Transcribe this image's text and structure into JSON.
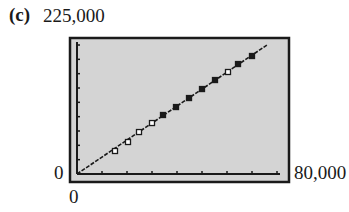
{
  "figure": {
    "panel_label": "(c)",
    "y_max_label": "225,000",
    "y_min_label": "0",
    "x_min_label": "0",
    "x_max_label": "80,000"
  },
  "colors": {
    "frame": "#1a1a1a",
    "plot_background": "#d4d4d4",
    "line": "#1a1a1a",
    "marker": "#1a1a1a"
  },
  "chart_data": {
    "type": "scatter",
    "title": "",
    "panel": "(c)",
    "xlabel": "",
    "ylabel": "",
    "xlim": [
      0,
      80000
    ],
    "ylim": [
      0,
      225000
    ],
    "x_tick_step": 10000,
    "y_tick_step": 25000,
    "grid": false,
    "legend": null,
    "series": [
      {
        "name": "data points",
        "marker": "square",
        "points": [
          {
            "x": 15200,
            "y": 40100,
            "filled": false
          },
          {
            "x": 20400,
            "y": 55800,
            "filled": false
          },
          {
            "x": 24800,
            "y": 73200,
            "filled": false
          },
          {
            "x": 30000,
            "y": 88900,
            "filled": false
          },
          {
            "x": 34400,
            "y": 102900,
            "filled": true
          },
          {
            "x": 39600,
            "y": 116800,
            "filled": true
          },
          {
            "x": 44800,
            "y": 132500,
            "filled": true
          },
          {
            "x": 50000,
            "y": 148200,
            "filled": true
          },
          {
            "x": 55200,
            "y": 163900,
            "filled": true
          },
          {
            "x": 60400,
            "y": 177900,
            "filled": false
          },
          {
            "x": 64400,
            "y": 191800,
            "filled": true
          },
          {
            "x": 70000,
            "y": 205800,
            "filled": true
          }
        ]
      },
      {
        "name": "regression line",
        "type": "line",
        "points": [
          {
            "x": 0,
            "y": 0
          },
          {
            "x": 76000,
            "y": 225000
          }
        ]
      }
    ]
  }
}
